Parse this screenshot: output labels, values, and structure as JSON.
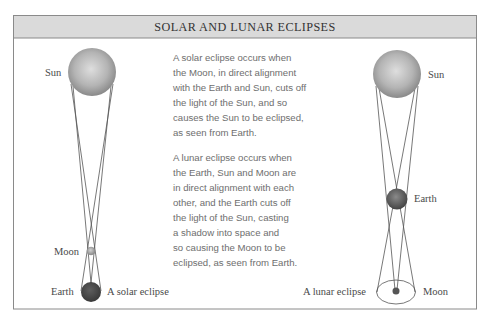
{
  "title": "SOLAR AND LUNAR ECLIPSES",
  "solar_diagram": {
    "caption": "A solar eclipse",
    "labels": {
      "sun": "Sun",
      "moon": "Moon",
      "earth": "Earth"
    }
  },
  "lunar_diagram": {
    "caption": "A lunar eclipse",
    "labels": {
      "sun": "Sun",
      "earth": "Earth",
      "moon": "Moon"
    }
  },
  "text": {
    "solar_paragraph": {
      "lines": [
        "A solar eclipse occurs when",
        "the Moon, in direct alignment",
        "with the Earth and Sun, cuts off",
        "the light of the Sun, and so",
        "causes the Sun to be eclipsed,",
        "as seen from Earth."
      ]
    },
    "lunar_paragraph": {
      "lines": [
        "A lunar eclipse occurs when",
        "the Earth, Sun and Moon are",
        "in direct alignment with each",
        "other, and the Earth cuts off",
        "the light of the Sun, casting",
        "a shadow into space and",
        "so causing the Moon to be",
        "eclipsed, as seen from Earth."
      ]
    }
  },
  "colors": {
    "header_fill": "#dadada",
    "frame_border": "#8a8a8a",
    "sun_highlight": "#dcdcdc",
    "sun_edge": "#8a8a8a",
    "earth": "#4a4a4a",
    "moon_solar": "#b0b0b0",
    "moon_lunar": "#555555",
    "ray_lines": "#555555"
  }
}
